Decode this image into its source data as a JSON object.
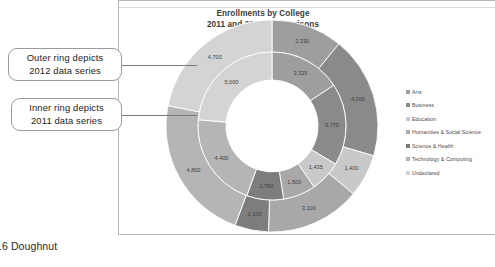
{
  "document": {
    "bottom_caption": "16 Doughnut"
  },
  "callouts": [
    {
      "name": "outer-ring-callout",
      "line1": "Outer ring depicts",
      "line2": "2012 data series"
    },
    {
      "name": "inner-ring-callout",
      "line1": "Inner ring depicts",
      "line2": "2011 data series"
    }
  ],
  "legend": {
    "position": "right",
    "items": [
      {
        "label": "Arts",
        "color": "#9e9e9e"
      },
      {
        "label": "Business",
        "color": "#8a8a8a"
      },
      {
        "label": "Education",
        "color": "#c9c9c9"
      },
      {
        "label": "Humanities & Social Science",
        "color": "#a8a8a8"
      },
      {
        "label": "Science & Health",
        "color": "#7d7d7d"
      },
      {
        "label": "Technology & Computing",
        "color": "#b5b5b5"
      },
      {
        "label": "Undeclared",
        "color": "#d4d4d4"
      }
    ]
  },
  "chart_data": {
    "type": "pie",
    "variant": "doughnut",
    "title": "Enrollments by College",
    "subtitle": "2011 and 2012 Comparisons",
    "xlabel": "",
    "ylabel": "",
    "grid": false,
    "categories": [
      "Arts",
      "Business",
      "Education",
      "Humanities & Social Science",
      "Science & Health",
      "Technology & Computing",
      "Undeclared"
    ],
    "colors": [
      "#9e9e9e",
      "#8a8a8a",
      "#c9c9c9",
      "#a8a8a8",
      "#7d7d7d",
      "#b5b5b5",
      "#d4d4d4"
    ],
    "series": [
      {
        "name": "2012",
        "ring": "outer",
        "values": [
          2330,
          4000,
          1400,
          3100,
          1100,
          4800,
          4700
        ],
        "labels": [
          "2,330",
          "4,000",
          "1,400",
          "3,100",
          "1,100",
          "4,800",
          "4,700"
        ]
      },
      {
        "name": "2011",
        "ring": "inner",
        "values": [
          3325,
          3775,
          1435,
          1500,
          1700,
          4400,
          5000
        ],
        "labels": [
          "3,325",
          "3,775",
          "1,435",
          "1,500",
          "1,700",
          "4,400",
          "5,000"
        ]
      }
    ]
  }
}
